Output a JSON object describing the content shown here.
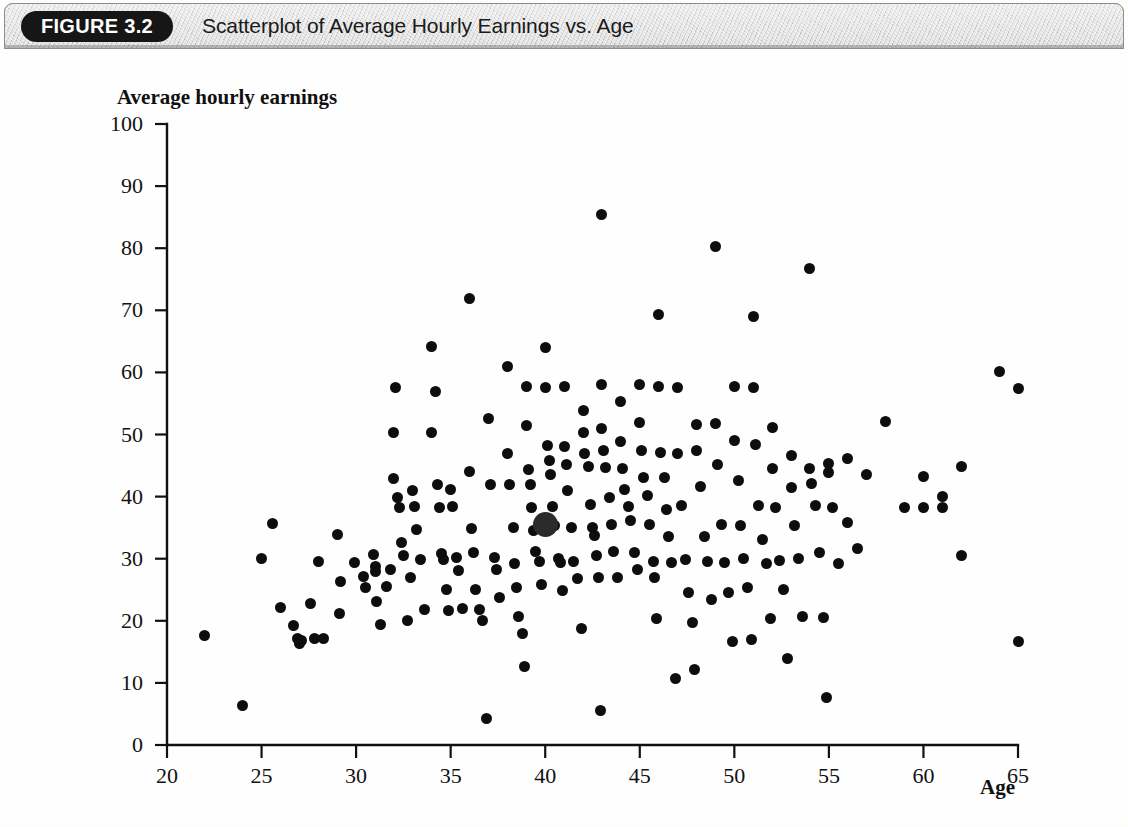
{
  "figure": {
    "badge": "FIGURE 3.2",
    "title": "Scatterplot of Average Hourly Earnings vs. Age"
  },
  "chart_data": {
    "type": "scatter",
    "title": "Scatterplot of Average Hourly Earnings vs. Age",
    "xlabel": "Age",
    "ylabel": "Average hourly earnings",
    "xlim": [
      20,
      65
    ],
    "ylim": [
      0,
      100
    ],
    "xticks": [
      20,
      25,
      30,
      35,
      40,
      45,
      50,
      55,
      60,
      65
    ],
    "yticks": [
      0,
      10,
      20,
      30,
      40,
      50,
      60,
      70,
      80,
      90,
      100
    ],
    "grid": false,
    "legend": null,
    "highlighted_point": {
      "x": 40,
      "y": 35.5,
      "note": "enlarged marker"
    },
    "points": [
      [
        22,
        17.7
      ],
      [
        24,
        6.3
      ],
      [
        25,
        30.1
      ],
      [
        25.6,
        35.6
      ],
      [
        26,
        22.1
      ],
      [
        26.7,
        19.3
      ],
      [
        26.9,
        17.2
      ],
      [
        27,
        16.4
      ],
      [
        27.1,
        16.9
      ],
      [
        27.6,
        22.8
      ],
      [
        27.8,
        17.1
      ],
      [
        28,
        29.5
      ],
      [
        28.3,
        17.1
      ],
      [
        29,
        33.9
      ],
      [
        29.1,
        21.2
      ],
      [
        29.2,
        26.4
      ],
      [
        29.9,
        29.4
      ],
      [
        30.4,
        27.2
      ],
      [
        30.5,
        25.3
      ],
      [
        30.9,
        30.7
      ],
      [
        31,
        28.7
      ],
      [
        31,
        27.9
      ],
      [
        31.1,
        23.1
      ],
      [
        31.3,
        19.4
      ],
      [
        31.6,
        25.6
      ],
      [
        31.8,
        28.2
      ],
      [
        32,
        50.4
      ],
      [
        32,
        42.9
      ],
      [
        32.1,
        57.6
      ],
      [
        32.2,
        39.8
      ],
      [
        32.3,
        38.2
      ],
      [
        32.4,
        32.6
      ],
      [
        32.5,
        30.5
      ],
      [
        32.7,
        20.1
      ],
      [
        32.9,
        26.9
      ],
      [
        33,
        41.0
      ],
      [
        33.1,
        38.4
      ],
      [
        33.2,
        34.7
      ],
      [
        33.4,
        29.8
      ],
      [
        33.6,
        21.8
      ],
      [
        34,
        64.2
      ],
      [
        34,
        50.3
      ],
      [
        34.2,
        57.0
      ],
      [
        34.3,
        41.9
      ],
      [
        34.4,
        38.2
      ],
      [
        34.5,
        30.9
      ],
      [
        34.6,
        29.9
      ],
      [
        34.8,
        25.1
      ],
      [
        34.9,
        21.6
      ],
      [
        35,
        41.2
      ],
      [
        35.1,
        38.4
      ],
      [
        35.3,
        30.2
      ],
      [
        35.4,
        28.1
      ],
      [
        35.6,
        22.0
      ],
      [
        36,
        71.9
      ],
      [
        36,
        44.0
      ],
      [
        36.1,
        34.8
      ],
      [
        36.2,
        31.0
      ],
      [
        36.3,
        25.0
      ],
      [
        36.5,
        21.9
      ],
      [
        36.7,
        20.0
      ],
      [
        36.9,
        4.3
      ],
      [
        37,
        52.6
      ],
      [
        37.1,
        41.9
      ],
      [
        37.3,
        30.2
      ],
      [
        37.4,
        28.2
      ],
      [
        37.6,
        23.8
      ],
      [
        38,
        60.9
      ],
      [
        38,
        46.9
      ],
      [
        38.1,
        42.0
      ],
      [
        38.3,
        35.0
      ],
      [
        38.4,
        29.3
      ],
      [
        38.5,
        25.4
      ],
      [
        38.6,
        20.7
      ],
      [
        38.8,
        17.9
      ],
      [
        38.9,
        12.6
      ],
      [
        39,
        57.8
      ],
      [
        39,
        51.5
      ],
      [
        39.1,
        44.4
      ],
      [
        39.2,
        42.0
      ],
      [
        39.3,
        38.3
      ],
      [
        39.4,
        34.5
      ],
      [
        39.5,
        31.1
      ],
      [
        39.7,
        29.5
      ],
      [
        39.8,
        25.8
      ],
      [
        40,
        64.0
      ],
      [
        40,
        57.6
      ],
      [
        40.1,
        48.3
      ],
      [
        40.2,
        45.8
      ],
      [
        40.3,
        43.6
      ],
      [
        40.4,
        38.4
      ],
      [
        40.5,
        35.3
      ],
      [
        40.7,
        30.1
      ],
      [
        40.8,
        29.4
      ],
      [
        40.9,
        24.9
      ],
      [
        41,
        57.8
      ],
      [
        41,
        48.0
      ],
      [
        41.1,
        45.2
      ],
      [
        41.2,
        41.0
      ],
      [
        41.4,
        35.0
      ],
      [
        41.5,
        29.5
      ],
      [
        41.7,
        26.8
      ],
      [
        41.9,
        18.7
      ],
      [
        42,
        53.8
      ],
      [
        42,
        50.4
      ],
      [
        42.1,
        46.9
      ],
      [
        42.3,
        44.9
      ],
      [
        42.4,
        38.8
      ],
      [
        42.5,
        35.1
      ],
      [
        42.6,
        33.8
      ],
      [
        42.7,
        30.5
      ],
      [
        42.8,
        27.0
      ],
      [
        42.9,
        5.5
      ],
      [
        43,
        85.4
      ],
      [
        43,
        58.0
      ],
      [
        43,
        51.0
      ],
      [
        43.1,
        47.4
      ],
      [
        43.2,
        44.7
      ],
      [
        43.4,
        39.8
      ],
      [
        43.5,
        35.5
      ],
      [
        43.6,
        31.1
      ],
      [
        43.8,
        26.9
      ],
      [
        44,
        55.3
      ],
      [
        44,
        48.9
      ],
      [
        44.1,
        44.6
      ],
      [
        44.2,
        41.2
      ],
      [
        44.4,
        38.4
      ],
      [
        44.5,
        36.1
      ],
      [
        44.7,
        31.0
      ],
      [
        44.9,
        28.2
      ],
      [
        45,
        58.0
      ],
      [
        45,
        51.9
      ],
      [
        45.1,
        47.5
      ],
      [
        45.2,
        43.0
      ],
      [
        45.4,
        40.1
      ],
      [
        45.5,
        35.5
      ],
      [
        45.7,
        29.5
      ],
      [
        45.8,
        26.9
      ],
      [
        45.9,
        20.4
      ],
      [
        46,
        69.4
      ],
      [
        46,
        57.8
      ],
      [
        46.1,
        47.1
      ],
      [
        46.3,
        43.1
      ],
      [
        46.4,
        37.9
      ],
      [
        46.5,
        33.6
      ],
      [
        46.7,
        29.4
      ],
      [
        46.9,
        10.7
      ],
      [
        47,
        57.5
      ],
      [
        47,
        46.9
      ],
      [
        47.2,
        38.6
      ],
      [
        47.4,
        29.9
      ],
      [
        47.6,
        24.6
      ],
      [
        47.8,
        19.8
      ],
      [
        47.9,
        12.1
      ],
      [
        48,
        51.6
      ],
      [
        48,
        47.4
      ],
      [
        48.2,
        41.6
      ],
      [
        48.4,
        33.6
      ],
      [
        48.6,
        29.6
      ],
      [
        48.8,
        23.5
      ],
      [
        49,
        80.3
      ],
      [
        49,
        51.8
      ],
      [
        49.1,
        45.2
      ],
      [
        49.3,
        35.5
      ],
      [
        49.5,
        29.4
      ],
      [
        49.7,
        24.6
      ],
      [
        49.9,
        16.7
      ],
      [
        50,
        57.7
      ],
      [
        50,
        49.1
      ],
      [
        50.2,
        42.6
      ],
      [
        50.3,
        35.3
      ],
      [
        50.5,
        30.1
      ],
      [
        50.7,
        25.4
      ],
      [
        50.9,
        17.0
      ],
      [
        51,
        69.0
      ],
      [
        51,
        57.6
      ],
      [
        51.1,
        48.4
      ],
      [
        51.3,
        38.5
      ],
      [
        51.5,
        33.1
      ],
      [
        51.7,
        29.3
      ],
      [
        51.9,
        20.4
      ],
      [
        52,
        51.1
      ],
      [
        52,
        44.5
      ],
      [
        52.2,
        38.3
      ],
      [
        52.4,
        29.7
      ],
      [
        52.6,
        25.1
      ],
      [
        52.8,
        14.0
      ],
      [
        53,
        46.6
      ],
      [
        53,
        41.4
      ],
      [
        53.2,
        35.3
      ],
      [
        53.4,
        30.0
      ],
      [
        53.6,
        20.7
      ],
      [
        54,
        76.8
      ],
      [
        54,
        44.5
      ],
      [
        54.1,
        42.1
      ],
      [
        54.3,
        38.5
      ],
      [
        54.5,
        31.0
      ],
      [
        54.7,
        20.6
      ],
      [
        54.9,
        7.7
      ],
      [
        55,
        45.3
      ],
      [
        55,
        43.9
      ],
      [
        55.2,
        38.3
      ],
      [
        55.5,
        29.3
      ],
      [
        56,
        46.2
      ],
      [
        56,
        35.8
      ],
      [
        56.5,
        31.6
      ],
      [
        57,
        43.6
      ],
      [
        58,
        52.1
      ],
      [
        59,
        38.3
      ],
      [
        60,
        38.3
      ],
      [
        60,
        43.3
      ],
      [
        61,
        38.3
      ],
      [
        61,
        40.0
      ],
      [
        62,
        44.8
      ],
      [
        62,
        30.5
      ],
      [
        64,
        60.2
      ],
      [
        65,
        57.4
      ],
      [
        65,
        16.7
      ]
    ]
  }
}
